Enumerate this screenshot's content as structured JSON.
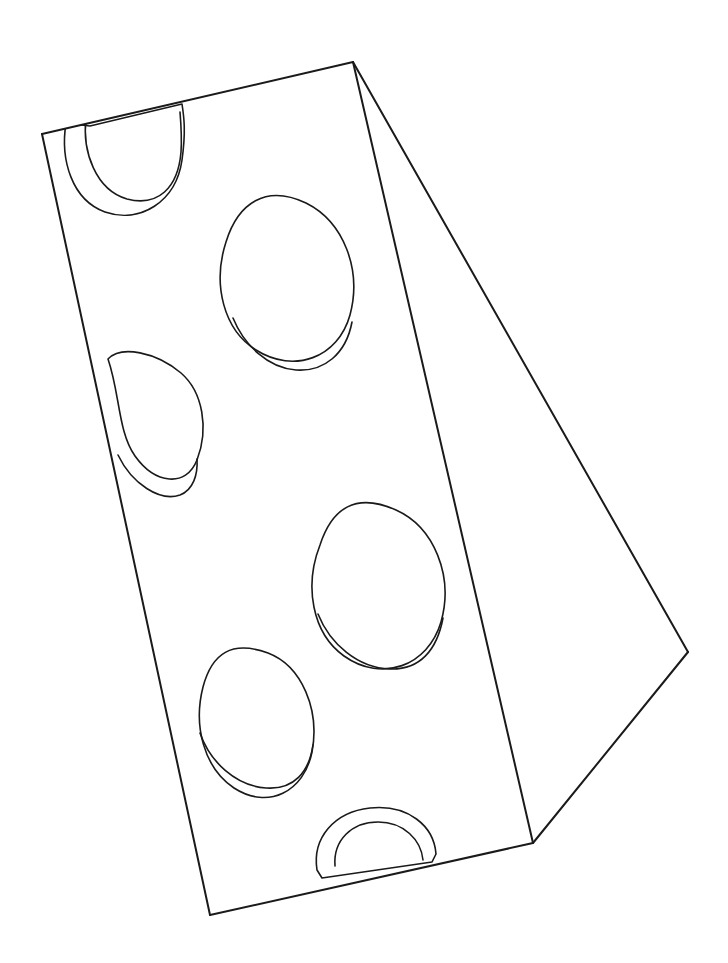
{
  "document": {
    "kind": "line-drawing",
    "subject": "swiss-cheese-block",
    "description": "Black outline line drawing of a rectangular 3D block shown in perspective, with several rounded holes cut into its large top face.",
    "background_color": "#ffffff",
    "stroke_color": "#1a1a1a",
    "stroke_width": 2.0,
    "thin_stroke_width": 1.6,
    "canvas": {
      "width": 728,
      "height": 963
    }
  },
  "geometry": {
    "vertices": {
      "top_left": {
        "x": 42,
        "y": 134
      },
      "top_apex": {
        "x": 353,
        "y": 62
      },
      "bottom_left": {
        "x": 210,
        "y": 915
      },
      "bottom_mid": {
        "x": 533,
        "y": 843
      },
      "right_point": {
        "x": 688,
        "y": 652
      }
    },
    "faces": [
      {
        "name": "top-face",
        "points": "42,134 353,62 533,843 210,915"
      },
      {
        "name": "side-face",
        "points": "353,62 688,652 533,843"
      }
    ],
    "edges": [
      {
        "name": "edge-top",
        "from": "top_left",
        "to": "top_apex"
      },
      {
        "name": "edge-left",
        "from": "top_left",
        "to": "bottom_left"
      },
      {
        "name": "edge-bottom",
        "from": "bottom_left",
        "to": "bottom_mid"
      },
      {
        "name": "edge-crease",
        "from": "top_apex",
        "to": "bottom_mid"
      },
      {
        "name": "edge-side-upper",
        "from": "top_apex",
        "to": "right_point"
      },
      {
        "name": "edge-side-lower",
        "from": "right_point",
        "to": "bottom_mid"
      }
    ],
    "holes": [
      {
        "name": "hole-top-left",
        "clipped_by": "edge-top",
        "rim": "M 66 123 C 60 160, 72 200, 105 212 C 140 224, 176 202, 182 160 C 186 131, 184 117, 182 104 L 90 126 Z",
        "inner": "M 86 118 C 82 152, 96 190, 127 199 C 158 207, 178 188, 181 152 C 182 137, 181 124, 180 112"
      },
      {
        "name": "hole-upper-center",
        "clipped_by": null,
        "rim": "M 226 242 C 212 285, 224 330, 256 350 C 294 374, 338 358, 350 315 C 362 270, 344 222, 306 203 C 266 184, 238 203, 226 242 Z",
        "inner": "M 233 318 C 244 345, 268 368, 296 370 C 324 372, 346 354, 352 322"
      },
      {
        "name": "hole-left-mid",
        "clipped_by": "edge-left",
        "rim": "M 108 359 C 120 394, 118 432, 135 456 C 155 484, 186 488, 197 460 C 209 429, 203 392, 181 373 C 156 352, 121 345, 108 359 Z",
        "inner": "M 118 455 C 132 484, 160 502, 180 495 C 193 490, 198 475, 197 459"
      },
      {
        "name": "hole-center-right",
        "clipped_by": null,
        "rim": "M 320 545 C 304 586, 312 633, 344 656 C 382 683, 428 666, 441 622 C 454 576, 434 527, 396 510 C 356 492, 332 508, 320 545 Z",
        "inner": "M 318 614 C 330 644, 358 668, 390 669 C 420 670, 437 650, 443 618"
      },
      {
        "name": "hole-lower-left",
        "clipped_by": null,
        "rim": "M 203 687 C 193 726, 204 768, 234 788 C 268 810, 304 792, 312 752 C 320 710, 302 666, 268 653 C 232 640, 212 653, 203 687 Z",
        "inner": "M 200 733 C 210 762, 236 786, 266 788 C 294 790, 309 772, 313 745"
      },
      {
        "name": "hole-bottom",
        "clipped_by": "edge-bottom",
        "rim": "M 317 870 C 312 838, 334 812, 370 808 C 408 804, 434 826, 436 854 L 432 862 L 322 878 Z",
        "inner": "M 335 866 C 333 840, 352 822, 378 822 C 404 822, 421 840, 423 860"
      }
    ]
  }
}
